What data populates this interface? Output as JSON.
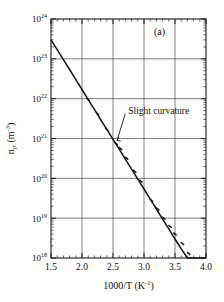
{
  "figure": {
    "panel_label": "(a)",
    "background_color": "#fdfdfb",
    "ink_color": "#141414",
    "grid_color": "#4a4a4a"
  },
  "chart_data": {
    "type": "line",
    "title": "",
    "subtitle": "",
    "panel": "(a)",
    "scale": {
      "x": "linear",
      "y": "log"
    },
    "xlabel_plain": "1000/T (K^-1)",
    "xlabel_main": "1000/T (K",
    "xlabel_exponent": "-1",
    "xlabel_close": ")",
    "ylabel_plain": "n_i, (m^-3)",
    "ylabel_main": "n",
    "ylabel_sub": "i",
    "ylabel_mid": ", (m",
    "ylabel_exponent": "-3",
    "ylabel_close": ")",
    "xlim": [
      1.5,
      4.0
    ],
    "ylim": [
      1e+18,
      1e+24
    ],
    "xticks": [
      1.5,
      2.0,
      2.5,
      3.0,
      3.5,
      4.0
    ],
    "xtick_labels": [
      "1.5",
      "2.0",
      "2.5",
      "3.0",
      "3.5",
      "4.0"
    ],
    "yticks_exponents": [
      24,
      23,
      22,
      21,
      20,
      19,
      18
    ],
    "ytick_mantissa": "10",
    "ytick_labels": [
      "10^24",
      "10^23",
      "10^22",
      "10^21",
      "10^20",
      "10^19",
      "10^18"
    ],
    "grid": {
      "x": true,
      "y": true,
      "minor": false
    },
    "legend": {
      "visible": false,
      "position": "none"
    },
    "series": [
      {
        "name": "intrinsic carrier concentration",
        "x": [
          1.5,
          1.6,
          1.7,
          1.8,
          1.9,
          2.0,
          2.1,
          2.2,
          2.3,
          2.4,
          2.5,
          2.6,
          2.7,
          2.8,
          2.9,
          3.0,
          3.1,
          3.2,
          3.3,
          3.4,
          3.5,
          3.6,
          3.7,
          3.8,
          3.9,
          4.0
        ],
        "y": [
          3e+23,
          1.7e+23,
          9.5e+22,
          5.4e+22,
          3e+22,
          1.7e+22,
          9.5e+21,
          5.4e+21,
          3e+21,
          1.7e+21,
          9.5e+20,
          5.4e+20,
          3e+20,
          1.7e+20,
          9.5e+19,
          5.4e+19,
          3e+19,
          1.7e+19,
          9.5e+18,
          5.4e+18,
          3e+18,
          1.7e+18,
          1e+18,
          6e+17,
          3.4e+17,
          1.9e+17
        ],
        "marker_x": [
          2.1,
          2.25,
          2.4,
          2.55,
          2.62,
          2.72,
          2.85,
          2.95,
          3.12,
          3.22,
          3.32,
          3.42,
          3.5,
          3.62,
          3.72,
          3.84
        ],
        "marker_y": [
          9.5e+21,
          4.2e+21,
          1.7e+21,
          7.5e+20,
          5.6e+20,
          3.2e+20,
          1.5e+20,
          8.5e+19,
          2.8e+19,
          1.7e+19,
          1e+19,
          6.2e+18,
          4e+18,
          2.3e+18,
          1.3e+18,
          7e+17
        ]
      }
    ],
    "annotations": [
      {
        "text": "Slight curvature",
        "target_x": 2.55,
        "target_y": 8.5e+20,
        "label_x": 2.73,
        "label_y": 5e+21
      }
    ]
  }
}
